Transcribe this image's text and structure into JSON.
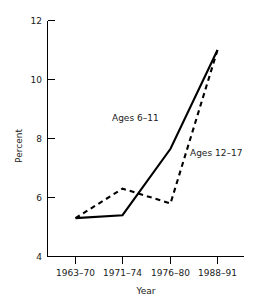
{
  "chart_data": {
    "type": "line",
    "title": "",
    "subtitle": "",
    "xlabel": "Year",
    "ylabel": "Percent",
    "categories": [
      "1963–70",
      "1971–74",
      "1976–80",
      "1988–91"
    ],
    "ylim": [
      4,
      12
    ],
    "yticks": [
      4,
      6,
      8,
      10,
      12
    ],
    "ytick_labels": [
      "4",
      "6",
      "8",
      "10",
      "12"
    ],
    "grid": false,
    "legend_position": "inline-annotation",
    "series": [
      {
        "name": "Ages 6–11",
        "style": "solid",
        "color": "#000000",
        "values": [
          5.3,
          5.4,
          7.65,
          11.0
        ]
      },
      {
        "name": "Ages 12–17",
        "style": "dashed",
        "color": "#000000",
        "values": [
          5.3,
          6.3,
          5.8,
          11.0
        ]
      }
    ],
    "annotations": [
      {
        "text": "Ages 6–11",
        "series": "Ages 6–11"
      },
      {
        "text": "Ages 12–17",
        "series": "Ages 12–17"
      }
    ]
  },
  "axes": {
    "y": {
      "title": "Percent",
      "labels": [
        "12",
        "10",
        "8",
        "6",
        "4"
      ]
    },
    "x": {
      "title": "Year",
      "labels": [
        "1963–70",
        "1971–74",
        "1976–80",
        "1988–91"
      ]
    }
  },
  "series_labels": {
    "solid": "Ages 6–11",
    "dashed": "Ages 12–17"
  },
  "colors": {
    "background": "#ffffff",
    "ink": "#000000",
    "text": "#1a1a1a"
  }
}
